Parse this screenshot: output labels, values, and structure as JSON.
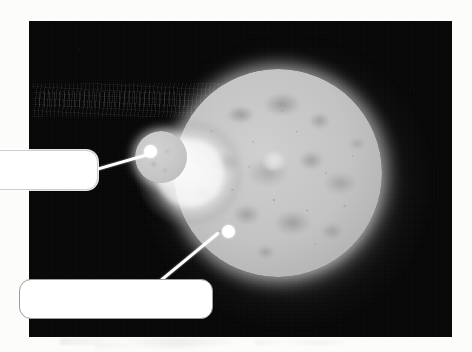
{
  "page": {
    "background_color": "#fcfcfb",
    "caption": ""
  },
  "photo": {
    "name": "astronomical-plate",
    "background_color": "#060606",
    "bounds": {
      "x": 29,
      "y": 21,
      "width": 423,
      "height": 316
    },
    "description": "Dark photographic plate of two glowing spherical bodies against a black star field"
  },
  "bodies": [
    {
      "id": "moon-major",
      "label": "",
      "center": {
        "x": 249,
        "y": 152
      },
      "radius": 104,
      "surface_color": "#c2c2c2",
      "glow_color": "#ffffff",
      "description": "Large mottled grey sphere with dark maria patches and a bright white limb halo"
    },
    {
      "id": "moon-minor",
      "label": "",
      "center": {
        "x": 161,
        "y": 157
      },
      "radius": 26,
      "surface_color": "#c6c6c6",
      "glow_color": "#ffffff",
      "description": "Small grey sphere overlapping the upper-left limb of the large sphere"
    }
  ],
  "annotations": [
    {
      "id": "annotation-top",
      "text": "",
      "box": {
        "x": -42,
        "y": 150,
        "width": 140,
        "height": 40
      },
      "target_point": {
        "x": 150,
        "y": 151
      },
      "leader_color": "#ffffff",
      "box_fill": "#ffffff",
      "box_border": "#cfcfcf"
    },
    {
      "id": "annotation-bottom",
      "text": "",
      "box": {
        "x": 19,
        "y": 279,
        "width": 194,
        "height": 40
      },
      "target_point": {
        "x": 228,
        "y": 231
      },
      "leader_color": "#ffffff",
      "box_fill": "#ffffff",
      "box_border": "#9d9d9d"
    }
  ],
  "colors": {
    "plate": "#060606",
    "paper": "#fcfcfb",
    "body_surface": "#c2c2c2",
    "highlight": "#ffffff",
    "maria": "#787878",
    "callout_border": "#9d9d9d"
  }
}
